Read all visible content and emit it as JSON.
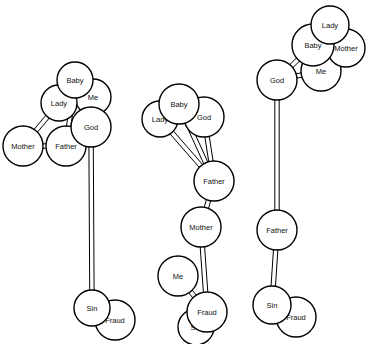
{
  "figure": {
    "type": "node-link-diagram",
    "background_color": "#ffffff",
    "node_fill_color": "#ffffff",
    "node_stroke_color": "#000000",
    "edge_color": "#000000",
    "edge_style": "double-line ribbon",
    "node_radius": 18,
    "clusters": [
      {
        "id": "cluster-1",
        "nodes": [
          {
            "id": "c1-baby",
            "label": "Baby",
            "cx": 75,
            "cy": 80,
            "r": 18,
            "z": 6
          },
          {
            "id": "c1-me",
            "label": "Me",
            "cx": 93,
            "cy": 97,
            "r": 18,
            "z": 3
          },
          {
            "id": "c1-lady",
            "label": "Lady",
            "cx": 59,
            "cy": 103,
            "r": 18,
            "z": 5
          },
          {
            "id": "c1-god",
            "label": "God",
            "cx": 91,
            "cy": 127,
            "r": 20,
            "z": 4
          },
          {
            "id": "c1-father",
            "label": "Father",
            "cx": 66,
            "cy": 146,
            "r": 20,
            "z": 2
          },
          {
            "id": "c1-mother",
            "label": "Mother",
            "cx": 23,
            "cy": 146,
            "r": 20,
            "z": 1
          },
          {
            "id": "c1-sin",
            "label": "Sin",
            "cx": 92,
            "cy": 308,
            "r": 18,
            "z": 2
          },
          {
            "id": "c1-fraud",
            "label": "Fraud",
            "cx": 115,
            "cy": 320,
            "r": 20,
            "z": 1
          }
        ],
        "edges": [
          {
            "from": "c1-baby",
            "to": "c1-father"
          },
          {
            "from": "c1-baby",
            "to": "c1-god"
          },
          {
            "from": "c1-lady",
            "to": "c1-mother"
          },
          {
            "from": "c1-me",
            "to": "c1-god"
          },
          {
            "from": "c1-mother",
            "to": "c1-father"
          },
          {
            "from": "c1-god",
            "to": "c1-sin"
          }
        ]
      },
      {
        "id": "cluster-2",
        "nodes": [
          {
            "id": "c2-baby",
            "label": "Baby",
            "cx": 179,
            "cy": 104,
            "r": 20,
            "z": 6
          },
          {
            "id": "c2-lady",
            "label": "Lady",
            "cx": 160,
            "cy": 119,
            "r": 18,
            "z": 5
          },
          {
            "id": "c2-god",
            "label": "God",
            "cx": 204,
            "cy": 117,
            "r": 20,
            "z": 4
          },
          {
            "id": "c2-father",
            "label": "Father",
            "cx": 214,
            "cy": 181,
            "r": 20,
            "z": 3
          },
          {
            "id": "c2-mother",
            "label": "Mother",
            "cx": 201,
            "cy": 227,
            "r": 20,
            "z": 3
          },
          {
            "id": "c2-me",
            "label": "Me",
            "cx": 178,
            "cy": 276,
            "r": 20,
            "z": 3
          },
          {
            "id": "c2-fraud",
            "label": "Fraud",
            "cx": 207,
            "cy": 312,
            "r": 20,
            "z": 2
          },
          {
            "id": "c2-sin",
            "label": "Sin",
            "cx": 196,
            "cy": 327,
            "r": 18,
            "z": 1
          }
        ],
        "edges": [
          {
            "from": "c2-lady",
            "to": "c2-father"
          },
          {
            "from": "c2-baby",
            "to": "c2-father"
          },
          {
            "from": "c2-god",
            "to": "c2-father"
          },
          {
            "from": "c2-father",
            "to": "c2-mother"
          },
          {
            "from": "c2-mother",
            "to": "c2-fraud"
          },
          {
            "from": "c2-me",
            "to": "c2-fraud"
          }
        ]
      },
      {
        "id": "cluster-3",
        "nodes": [
          {
            "id": "c3-lady",
            "label": "Lady",
            "cx": 330,
            "cy": 25,
            "r": 19,
            "z": 6
          },
          {
            "id": "c3-baby",
            "label": "Baby",
            "cx": 313,
            "cy": 45,
            "r": 21,
            "z": 5
          },
          {
            "id": "c3-mother",
            "label": "Mother",
            "cx": 346,
            "cy": 48,
            "r": 19,
            "z": 4
          },
          {
            "id": "c3-me",
            "label": "Me",
            "cx": 321,
            "cy": 71,
            "r": 20,
            "z": 3
          },
          {
            "id": "c3-god",
            "label": "God",
            "cx": 277,
            "cy": 80,
            "r": 20,
            "z": 2
          },
          {
            "id": "c3-father",
            "label": "Father",
            "cx": 277,
            "cy": 230,
            "r": 20,
            "z": 2
          },
          {
            "id": "c3-sin",
            "label": "Sin",
            "cx": 272,
            "cy": 305,
            "r": 19,
            "z": 2
          },
          {
            "id": "c3-fraud",
            "label": "Fraud",
            "cx": 296,
            "cy": 317,
            "r": 20,
            "z": 1
          }
        ],
        "edges": [
          {
            "from": "c3-god",
            "to": "c3-baby"
          },
          {
            "from": "c3-god",
            "to": "c3-me"
          },
          {
            "from": "c3-god",
            "to": "c3-father"
          },
          {
            "from": "c3-father",
            "to": "c3-sin"
          }
        ]
      }
    ]
  }
}
